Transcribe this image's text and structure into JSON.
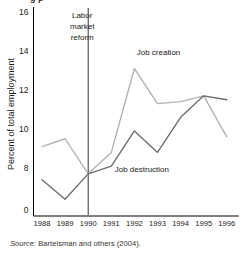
{
  "figure": {
    "title_fragment": "g p",
    "source_prefix": "Source:",
    "source_text": "Bartelsman and others (2004)."
  },
  "chart_data": {
    "type": "line",
    "title": "",
    "xlabel": "",
    "ylabel": "Percent of total employment",
    "categories": [
      "1988",
      "1989",
      "1990",
      "1991",
      "1992",
      "1993",
      "1994",
      "1995",
      "1996"
    ],
    "x": [
      1988,
      1989,
      1990,
      1991,
      1992,
      1993,
      1994,
      1995,
      1996
    ],
    "yticks": [
      "0",
      "8",
      "10",
      "12",
      "14",
      "16"
    ],
    "ytick_values": [
      0,
      8,
      10,
      12,
      14,
      16
    ],
    "ylim": [
      7.6,
      16
    ],
    "axis_break": true,
    "grid": false,
    "legend": "inline-annotations",
    "series": [
      {
        "name": "Job creation",
        "color": "#b0b0b0",
        "values": [
          9.1,
          9.5,
          7.7,
          8.8,
          13.1,
          11.3,
          11.4,
          11.7,
          9.6
        ]
      },
      {
        "name": "Job destruction",
        "color": "#6b6b6b",
        "values": [
          7.4,
          6.4,
          7.7,
          8.1,
          9.9,
          8.8,
          10.6,
          11.7,
          11.5
        ]
      }
    ],
    "annotations": [
      {
        "id": "reform",
        "text": "Labor\nmarket\nreform",
        "lines": [
          "Labor",
          "market",
          "reform"
        ],
        "at_x": 1990,
        "type": "vertical-event-line"
      },
      {
        "id": "creation-label",
        "text": "Job creation",
        "at_x": 1992.1,
        "at_y": 13.95
      },
      {
        "id": "destruction-label",
        "text": "Job destruction",
        "at_x": 1991.15,
        "at_y": 7.95
      }
    ]
  }
}
